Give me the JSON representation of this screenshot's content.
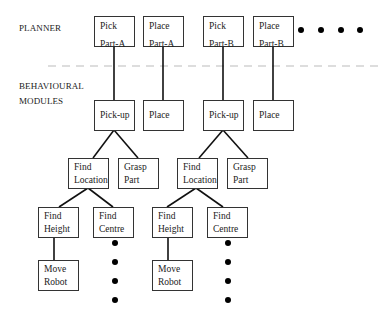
{
  "levels": {
    "planner": "PLANNER",
    "behavioural_line1": "BEHAVIOURAL",
    "behavioural_line2": "MODULES"
  },
  "planner_tasks": [
    {
      "l1": "Pick",
      "l2": "Part-A"
    },
    {
      "l1": "Place",
      "l2": "Part-A"
    },
    {
      "l1": "Pick",
      "l2": "Part-B"
    },
    {
      "l1": "Place",
      "l2": "Part-B"
    }
  ],
  "behaviours": [
    {
      "label": "Pick-up"
    },
    {
      "label": "Place"
    },
    {
      "label": "Pick-up"
    },
    {
      "label": "Place"
    }
  ],
  "subtasks_level3": [
    {
      "l1": "Find",
      "l2": "Location"
    },
    {
      "l1": "Grasp",
      "l2": "Part"
    },
    {
      "l1": "Find",
      "l2": "Location"
    },
    {
      "l1": "Grasp",
      "l2": "Part"
    }
  ],
  "subtasks_level4": [
    {
      "l1": "Find",
      "l2": "Height"
    },
    {
      "l1": "Find",
      "l2": "Centre"
    },
    {
      "l1": "Find",
      "l2": "Height"
    },
    {
      "l1": "Find",
      "l2": "Centre"
    }
  ],
  "subtasks_level5": [
    {
      "l1": "Move",
      "l2": "Robot"
    },
    {
      "l1": "Move",
      "l2": "Robot"
    }
  ],
  "colors": {
    "line": "#111111",
    "box_border": "#333333",
    "divider": "#bbbbbb"
  }
}
